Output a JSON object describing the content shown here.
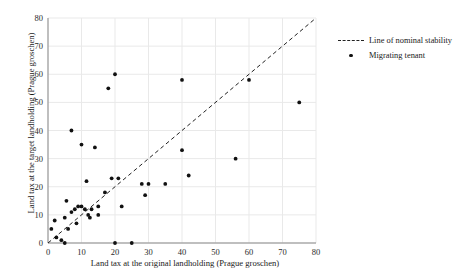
{
  "chart_data": {
    "type": "scatter",
    "title": "",
    "xlabel": "Land tax at the original landholding (Prague groschen)",
    "ylabel": "Land tax at the target landholding (Prague groschen)",
    "xlim": [
      0,
      80
    ],
    "ylim": [
      0,
      80
    ],
    "xticks": [
      0,
      10,
      20,
      30,
      40,
      50,
      60,
      70,
      80
    ],
    "yticks": [
      0,
      10,
      20,
      30,
      40,
      50,
      60,
      70,
      80
    ],
    "grid": true,
    "legend_position": "right",
    "series": [
      {
        "name": "Line of nominal stability",
        "type": "line",
        "style": "dashed",
        "color": "#222222",
        "points": [
          [
            0,
            0
          ],
          [
            80,
            80
          ]
        ]
      },
      {
        "name": "Migrating tenant",
        "type": "scatter",
        "marker": "circle",
        "color": "#111111",
        "points": [
          [
            1,
            5
          ],
          [
            2,
            8
          ],
          [
            2.5,
            2
          ],
          [
            4,
            1
          ],
          [
            5,
            0
          ],
          [
            5,
            9
          ],
          [
            5.5,
            15
          ],
          [
            6,
            5
          ],
          [
            7,
            11
          ],
          [
            7,
            40
          ],
          [
            8,
            12
          ],
          [
            8.5,
            7
          ],
          [
            9,
            13
          ],
          [
            10,
            13
          ],
          [
            10,
            35
          ],
          [
            11,
            12
          ],
          [
            11.5,
            22
          ],
          [
            12,
            10
          ],
          [
            12.5,
            9
          ],
          [
            13,
            12
          ],
          [
            14,
            34
          ],
          [
            15,
            10
          ],
          [
            15,
            13
          ],
          [
            17,
            18
          ],
          [
            18,
            55
          ],
          [
            19,
            23
          ],
          [
            20,
            60
          ],
          [
            20,
            0
          ],
          [
            21,
            23
          ],
          [
            22,
            13
          ],
          [
            25,
            0
          ],
          [
            28,
            21
          ],
          [
            29,
            17
          ],
          [
            30,
            21
          ],
          [
            35,
            21
          ],
          [
            40,
            33
          ],
          [
            40,
            58
          ],
          [
            42,
            24
          ],
          [
            56,
            30
          ],
          [
            60,
            58
          ],
          [
            75,
            50
          ]
        ]
      }
    ]
  },
  "legend": {
    "items": [
      {
        "label": "Line of nominal stability",
        "key": "dashed-line"
      },
      {
        "label": "Migrating tenant",
        "key": "dot-marker"
      }
    ]
  },
  "axes": {
    "x_tick_labels": [
      "0",
      "10",
      "20",
      "30",
      "40",
      "50",
      "60",
      "70",
      "80"
    ],
    "y_tick_labels": [
      "0",
      "10",
      "20",
      "30",
      "40",
      "50",
      "60",
      "70",
      "80"
    ]
  }
}
